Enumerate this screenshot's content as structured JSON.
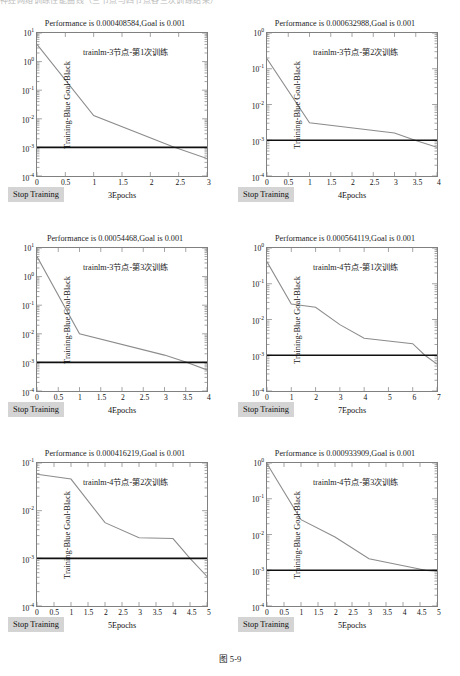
{
  "running_header": "神经网络训练性能曲线（三节点与四节点各三次训练结果）",
  "caption": "图 5-9",
  "common": {
    "ylabel": "Training-Blue Goal-Black",
    "stop_button": "Stop Training",
    "goal_value": 0.001,
    "goal_label": "Goal is 0.001",
    "title_prefix": "Performance is "
  },
  "panels": [
    {
      "id": "panel-1",
      "title": "Performance is 0.000408584,Goal is 0.001",
      "performance": "0.000408584",
      "goal": "0.001",
      "annotation": "trainlm-3节点-第1次训练",
      "xlabel": "3Epochs",
      "ylabel": "Training-Blue Goal-Black",
      "stop_button": "Stop Training",
      "yticks": [
        "10",
        "10",
        "10",
        "10",
        "10",
        "10"
      ],
      "ytick_exps": [
        "1",
        "0",
        "-1",
        "-2",
        "-3",
        "-4"
      ],
      "xticks": [
        "0",
        "0.5",
        "1",
        "1.5",
        "2",
        "2.5",
        "3"
      ],
      "chart_data": {
        "type": "line",
        "title": "Performance is 0.000408584,Goal is 0.001",
        "xlabel": "3Epochs",
        "ylabel": "Training-Blue Goal-Black",
        "yscale": "log",
        "xlim": [
          0,
          3
        ],
        "ylim": [
          0.0001,
          10
        ],
        "grid": false,
        "series": [
          {
            "name": "Training-Blue",
            "color": "#8c8c8c",
            "x": [
              0,
              1,
              2.4,
              3
            ],
            "y": [
              4.0,
              0.013,
              0.00105,
              0.000408584
            ]
          },
          {
            "name": "Goal-Black",
            "color": "#101010",
            "x": [
              0,
              3
            ],
            "y": [
              0.001,
              0.001
            ]
          }
        ]
      }
    },
    {
      "id": "panel-2",
      "title": "Performance is 0.000632988,Goal is 0.001",
      "performance": "0.000632988",
      "goal": "0.001",
      "annotation": "trainlm-3节点-第2次训练",
      "xlabel": "4Epochs",
      "ylabel": "Training-Blue Goal-Black",
      "stop_button": "Stop Training",
      "yticks": [
        "10",
        "10",
        "10",
        "10",
        "10"
      ],
      "ytick_exps": [
        "0",
        "-1",
        "-2",
        "-3",
        "-4"
      ],
      "xticks": [
        "0",
        "0.5",
        "1",
        "1.5",
        "2",
        "2.5",
        "3",
        "3.5",
        "4"
      ],
      "chart_data": {
        "type": "line",
        "title": "Performance is 0.000632988,Goal is 0.001",
        "xlabel": "4Epochs",
        "ylabel": "Training-Blue Goal-Black",
        "yscale": "log",
        "xlim": [
          0,
          4
        ],
        "ylim": [
          0.0001,
          1
        ],
        "grid": false,
        "series": [
          {
            "name": "Training-Blue",
            "color": "#8c8c8c",
            "x": [
              0,
              1,
              3,
              3.5,
              4
            ],
            "y": [
              0.19,
              0.0031,
              0.0016,
              0.00098,
              0.000632988
            ]
          },
          {
            "name": "Goal-Black",
            "color": "#101010",
            "x": [
              0,
              4
            ],
            "y": [
              0.001,
              0.001
            ]
          }
        ]
      }
    },
    {
      "id": "panel-3",
      "title": "Performance is 0.00054468,Goal is 0.001",
      "performance": "0.00054468",
      "goal": "0.001",
      "annotation": "trainlm-3节点-第3次训练",
      "xlabel": "4Epochs",
      "ylabel": "Training-Blue Goal-Black",
      "stop_button": "Stop Training",
      "yticks": [
        "10",
        "10",
        "10",
        "10",
        "10",
        "10"
      ],
      "ytick_exps": [
        "1",
        "0",
        "-1",
        "-2",
        "-3",
        "-4"
      ],
      "xticks": [
        "0",
        "0.5",
        "1",
        "1.5",
        "2",
        "2.5",
        "3",
        "3.5",
        "4"
      ],
      "chart_data": {
        "type": "line",
        "title": "Performance is 0.00054468,Goal is 0.001",
        "xlabel": "4Epochs",
        "ylabel": "Training-Blue Goal-Black",
        "yscale": "log",
        "xlim": [
          0,
          4
        ],
        "ylim": [
          0.0001,
          10
        ],
        "grid": false,
        "series": [
          {
            "name": "Training-Blue",
            "color": "#8c8c8c",
            "x": [
              0,
              1,
              3,
              3.5,
              4
            ],
            "y": [
              5.0,
              0.0101,
              0.0018,
              0.00104,
              0.00054468
            ]
          },
          {
            "name": "Goal-Black",
            "color": "#101010",
            "x": [
              0,
              4
            ],
            "y": [
              0.001,
              0.001
            ]
          }
        ]
      }
    },
    {
      "id": "panel-4",
      "title": "Performance is 0.000564119,Goal is 0.001",
      "performance": "0.000564119",
      "goal": "0.001",
      "annotation": "trainlm-4节点-第1次训练",
      "xlabel": "7Epochs",
      "ylabel": "Training-Blue Goal-Black",
      "stop_button": "Stop Training",
      "yticks": [
        "10",
        "10",
        "10",
        "10",
        "10"
      ],
      "ytick_exps": [
        "0",
        "-1",
        "-2",
        "-3",
        "-4"
      ],
      "xticks": [
        "0",
        "1",
        "2",
        "3",
        "4",
        "5",
        "6",
        "7"
      ],
      "chart_data": {
        "type": "line",
        "title": "Performance is 0.000564119,Goal is 0.001",
        "xlabel": "7Epochs",
        "ylabel": "Training-Blue Goal-Black",
        "yscale": "log",
        "xlim": [
          0,
          7
        ],
        "ylim": [
          0.0001,
          1
        ],
        "grid": false,
        "series": [
          {
            "name": "Training-Blue",
            "color": "#8c8c8c",
            "x": [
              0,
              1,
              2,
              3,
              4,
              6,
              6.5,
              7
            ],
            "y": [
              0.41,
              0.027,
              0.022,
              0.0072,
              0.003,
              0.0021,
              0.001,
              0.000564119
            ]
          },
          {
            "name": "Goal-Black",
            "color": "#101010",
            "x": [
              0,
              7
            ],
            "y": [
              0.001,
              0.001
            ]
          }
        ]
      }
    },
    {
      "id": "panel-5",
      "title": "Performance is 0.000416219,Goal is 0.001",
      "performance": "0.000416219",
      "goal": "0.001",
      "annotation": "trainlm-4节点-第2次训练",
      "xlabel": "5Epochs",
      "ylabel": "Training-Blue Goal-Black",
      "stop_button": "Stop Training",
      "yticks": [
        "10",
        "10",
        "10",
        "10"
      ],
      "ytick_exps": [
        "-1",
        "-2",
        "-3",
        "-4"
      ],
      "xticks": [
        "0",
        "0.5",
        "1",
        "1.5",
        "2",
        "2.5",
        "3",
        "3.5",
        "4",
        "4.5",
        "5"
      ],
      "chart_data": {
        "type": "line",
        "title": "Performance is 0.000416219,Goal is 0.001",
        "xlabel": "5Epochs",
        "ylabel": "Training-Blue Goal-Black",
        "yscale": "log",
        "xlim": [
          0,
          5
        ],
        "ylim": [
          0.0001,
          0.1
        ],
        "grid": false,
        "series": [
          {
            "name": "Training-Blue",
            "color": "#8c8c8c",
            "x": [
              0,
              1,
              2,
              3,
              4,
              4.5,
              5
            ],
            "y": [
              0.058,
              0.046,
              0.0056,
              0.0027,
              0.0026,
              0.001,
              0.000416219
            ]
          },
          {
            "name": "Goal-Black",
            "color": "#101010",
            "x": [
              0,
              5
            ],
            "y": [
              0.001,
              0.001
            ]
          }
        ]
      }
    },
    {
      "id": "panel-6",
      "title": "Performance is 0.000933909,Goal is 0.001",
      "performance": "0.000933909",
      "goal": "0.001",
      "annotation": "trainlm-4节点-第3次训练",
      "xlabel": "5Epochs",
      "ylabel": "Training-Blue Goal-Black",
      "stop_button": "Stop Training",
      "yticks": [
        "10",
        "10",
        "10",
        "10",
        "10"
      ],
      "ytick_exps": [
        "0",
        "-1",
        "-2",
        "-3",
        "-4"
      ],
      "xticks": [
        "0",
        "0.5",
        "1",
        "1.5",
        "2",
        "2.5",
        "3",
        "3.5",
        "4",
        "4.5",
        "5"
      ],
      "chart_data": {
        "type": "line",
        "title": "Performance is 0.000933909,Goal is 0.001",
        "xlabel": "5Epochs",
        "ylabel": "Training-Blue Goal-Black",
        "yscale": "log",
        "xlim": [
          0,
          5
        ],
        "ylim": [
          0.0001,
          1
        ],
        "grid": false,
        "series": [
          {
            "name": "Training-Blue",
            "color": "#8c8c8c",
            "x": [
              0,
              1,
              2,
              3,
              4.7,
              5
            ],
            "y": [
              0.95,
              0.026,
              0.0085,
              0.0021,
              0.00098,
              0.000933909
            ]
          },
          {
            "name": "Goal-Black",
            "color": "#101010",
            "x": [
              0,
              5
            ],
            "y": [
              0.001,
              0.001
            ]
          }
        ]
      }
    }
  ]
}
